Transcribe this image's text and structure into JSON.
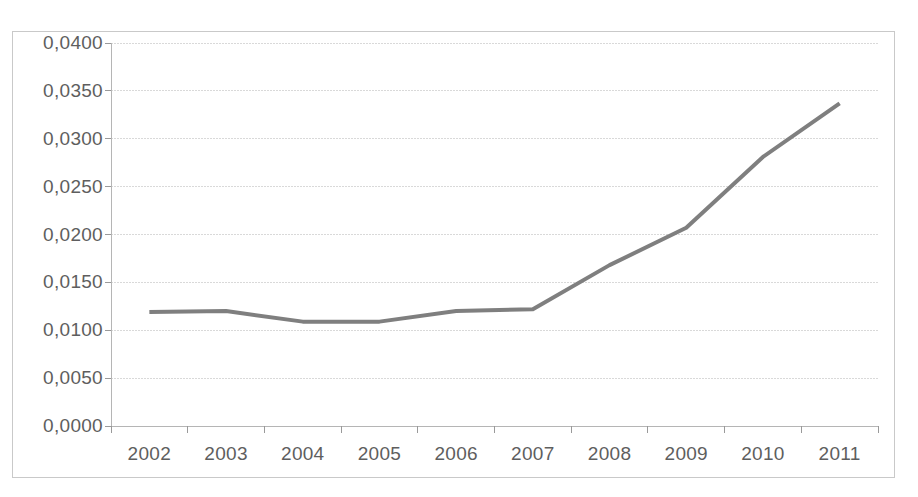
{
  "figure": {
    "top_caption": "",
    "background_color": "#ffffff",
    "border_color": "#c9c9c9"
  },
  "chart_data": {
    "type": "line",
    "title": "",
    "subtitle": "",
    "xlabel": "",
    "ylabel": "",
    "categories": [
      "2002",
      "2003",
      "2004",
      "2005",
      "2006",
      "2007",
      "2008",
      "2009",
      "2010",
      "2011"
    ],
    "series": [
      {
        "name": "series-1",
        "color": "#7f7f7f",
        "values": [
          0.0119,
          0.012,
          0.0109,
          0.0109,
          0.012,
          0.0122,
          0.0168,
          0.0207,
          0.0281,
          0.0337
        ]
      }
    ],
    "ylim": [
      0.0,
      0.04
    ],
    "ytick_values": [
      0.0,
      0.005,
      0.01,
      0.015,
      0.02,
      0.025,
      0.03,
      0.035,
      0.04
    ],
    "ytick_labels": [
      "0,0000",
      "0,0050",
      "0,0100",
      "0,0150",
      "0,0200",
      "0,0250",
      "0,0300",
      "0,0350",
      "0,0400"
    ],
    "xtick_labels": [
      "2002",
      "2003",
      "2004",
      "2005",
      "2006",
      "2007",
      "2008",
      "2009",
      "2010",
      "2011"
    ],
    "grid": {
      "horizontal": true,
      "vertical": false,
      "color": "#d9d9d9",
      "style": "dotted"
    },
    "legend": {
      "visible": false,
      "position": "none"
    },
    "decimal_separator": ",",
    "markers": false,
    "line_width_px": 4
  },
  "axis": {
    "y_labels": [
      "0,0400",
      "0,0350",
      "0,0300",
      "0,0250",
      "0,0200",
      "0,0150",
      "0,0100",
      "0,0050",
      "0,0000"
    ],
    "x_labels": [
      "2002",
      "2003",
      "2004",
      "2005",
      "2006",
      "2007",
      "2008",
      "2009",
      "2010",
      "2011"
    ]
  }
}
